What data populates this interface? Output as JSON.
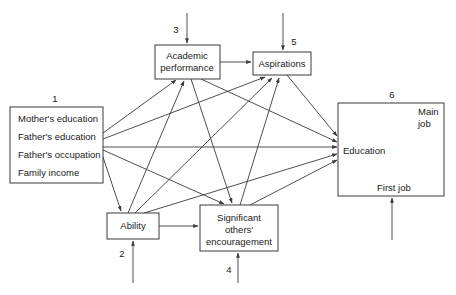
{
  "diagram": {
    "type": "path-diagram",
    "nodes": {
      "background": {
        "number": "1",
        "lines": [
          "Mother's education",
          "Father's education",
          "Father's occupation",
          "Family income"
        ]
      },
      "ability": {
        "number": "2",
        "lines": [
          "Ability"
        ]
      },
      "academic": {
        "number": "3",
        "lines": [
          "Academic",
          "performance"
        ]
      },
      "encouragement": {
        "number": "4",
        "lines": [
          "Significant",
          "others'",
          "encouragement"
        ]
      },
      "aspirations": {
        "number": "5",
        "lines": [
          "Aspirations"
        ]
      },
      "attainment": {
        "number": "6",
        "education": "Education",
        "main_job": [
          "Main",
          "job"
        ],
        "first_job": "First job"
      }
    },
    "edges": [
      {
        "from": "background",
        "to": "academic"
      },
      {
        "from": "background",
        "to": "aspirations"
      },
      {
        "from": "background",
        "to": "attainment"
      },
      {
        "from": "background",
        "to": "encouragement"
      },
      {
        "from": "background",
        "to": "ability"
      },
      {
        "from": "ability",
        "to": "academic"
      },
      {
        "from": "ability",
        "to": "aspirations"
      },
      {
        "from": "ability",
        "to": "encouragement"
      },
      {
        "from": "ability",
        "to": "attainment"
      },
      {
        "from": "academic",
        "to": "aspirations"
      },
      {
        "from": "academic",
        "to": "encouragement"
      },
      {
        "from": "academic",
        "to": "attainment"
      },
      {
        "from": "encouragement",
        "to": "aspirations"
      },
      {
        "from": "encouragement",
        "to": "attainment"
      },
      {
        "from": "aspirations",
        "to": "attainment"
      },
      {
        "from": "education",
        "to": "main_job"
      },
      {
        "from": "education",
        "to": "first_job"
      },
      {
        "from": "first_job",
        "to": "main_job"
      }
    ],
    "disturbance_arrows": [
      "ability",
      "academic",
      "encouragement",
      "aspirations",
      "attainment"
    ]
  }
}
